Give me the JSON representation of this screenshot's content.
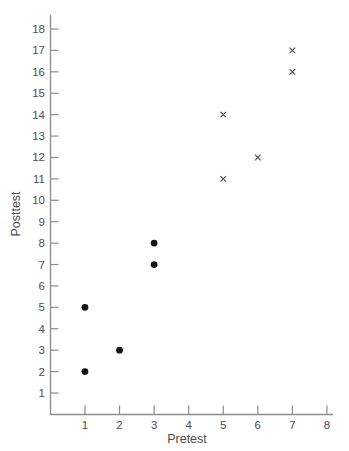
{
  "chart_data": {
    "type": "scatter",
    "title": "",
    "xlabel": "Pretest",
    "ylabel": "Posttest",
    "x_ticks": [
      1,
      2,
      3,
      4,
      5,
      6,
      7,
      8
    ],
    "y_ticks": [
      1,
      2,
      3,
      4,
      5,
      6,
      7,
      8,
      9,
      10,
      11,
      12,
      13,
      14,
      15,
      16,
      17,
      18
    ],
    "xlim": [
      0,
      8.2
    ],
    "ylim": [
      0,
      18.6
    ],
    "grid": false,
    "legend": "none",
    "series": [
      {
        "name": "filled-dot-group",
        "marker": "filled-circle",
        "color": "#151515",
        "points": [
          [
            1,
            2
          ],
          [
            1,
            5
          ],
          [
            2,
            3
          ],
          [
            3,
            7
          ],
          [
            3,
            8
          ]
        ]
      },
      {
        "name": "cross-group",
        "marker": "x",
        "color": "#4a4a4a",
        "points": [
          [
            5,
            11
          ],
          [
            5,
            14
          ],
          [
            6,
            12
          ],
          [
            7,
            16
          ],
          [
            7,
            17
          ]
        ]
      }
    ]
  },
  "colors": {
    "background": "#ffffff",
    "axis": "#8c8c8c",
    "tick_label": "#4d4d4d"
  }
}
